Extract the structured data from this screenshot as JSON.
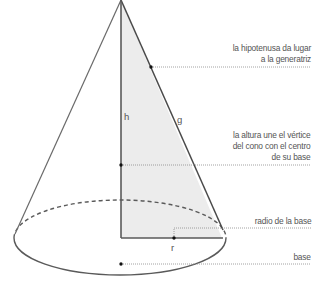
{
  "diagram": {
    "title": "Cono",
    "variables": {
      "h": "h",
      "g": "g",
      "r": "r"
    },
    "annotations": {
      "hypotenuse": {
        "line1": "la hipotenusa da lugar",
        "line2": "a la generatriz"
      },
      "height": {
        "line1": "la altura une el vértice",
        "line2": "del cono con el centro",
        "line3": "de su base"
      },
      "radius": {
        "line1": "radio de la base"
      },
      "base": {
        "line1": "base"
      }
    },
    "colors": {
      "stroke": "#5a5a5a",
      "triangle_fill": "#ececec",
      "text": "#555555",
      "leader": "#8a8a8a"
    }
  }
}
